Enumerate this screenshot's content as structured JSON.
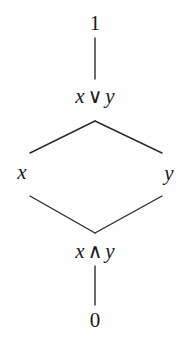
{
  "figure": {
    "kind": "hasse-diagram",
    "background_color": "#fefefe",
    "line_color": "#2b2b2b",
    "text_color": "#1a1a1a"
  },
  "nodes": [
    {
      "id": "top",
      "label": "1",
      "kind": "numeral",
      "x": 95,
      "y": 23
    },
    {
      "id": "join",
      "label": "x ∨ y",
      "kind": "expr",
      "left": "x",
      "op": "∨",
      "right": "y",
      "x": 95,
      "y": 96
    },
    {
      "id": "x",
      "label": "x",
      "kind": "variable",
      "x": 22,
      "y": 172
    },
    {
      "id": "y",
      "label": "y",
      "kind": "variable",
      "x": 169,
      "y": 173
    },
    {
      "id": "meet",
      "label": "x ∧ y",
      "kind": "expr",
      "left": "x",
      "op": "∧",
      "right": "y",
      "x": 95,
      "y": 251
    },
    {
      "id": "bottom",
      "label": "0",
      "kind": "numeral",
      "x": 95,
      "y": 320
    }
  ],
  "edges": [
    {
      "from": "top",
      "to": "join",
      "x1": 95,
      "y1": 38,
      "x2": 95,
      "y2": 79
    },
    {
      "from": "join",
      "to": "x",
      "x1": 95,
      "y1": 121,
      "x2": 30,
      "y2": 153
    },
    {
      "from": "join",
      "to": "y",
      "x1": 95,
      "y1": 121,
      "x2": 162,
      "y2": 153
    },
    {
      "from": "x",
      "to": "meet",
      "x1": 30,
      "y1": 196,
      "x2": 95,
      "y2": 233
    },
    {
      "from": "y",
      "to": "meet",
      "x1": 162,
      "y1": 196,
      "x2": 95,
      "y2": 233
    },
    {
      "from": "meet",
      "to": "bottom",
      "x1": 95,
      "y1": 266,
      "x2": 95,
      "y2": 305
    }
  ]
}
